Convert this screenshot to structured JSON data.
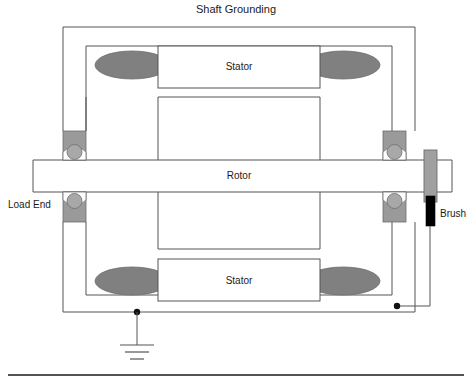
{
  "diagram": {
    "title": "Shaft Grounding",
    "labels": {
      "title": "Shaft Grounding",
      "stator_top": "Stator",
      "stator_bottom": "Stator",
      "rotor": "Rotor",
      "load_end": "Load End",
      "brush": "Brush"
    },
    "parts": [
      {
        "name": "frame-housing",
        "label": ""
      },
      {
        "name": "stator-core-top",
        "label": "Stator"
      },
      {
        "name": "stator-core-bottom",
        "label": "Stator"
      },
      {
        "name": "rotor-shaft",
        "label": "Rotor"
      },
      {
        "name": "bearing-load-end-top",
        "label": ""
      },
      {
        "name": "bearing-load-end-bottom",
        "label": ""
      },
      {
        "name": "bearing-drive-end-top",
        "label": ""
      },
      {
        "name": "bearing-drive-end-bottom",
        "label": ""
      },
      {
        "name": "slip-ring",
        "label": ""
      },
      {
        "name": "brush",
        "label": "Brush"
      },
      {
        "name": "ground-symbol",
        "label": ""
      }
    ],
    "colors": {
      "line": "#555555",
      "line_dark": "#1b1b1b",
      "end_winding_fill": "#808080",
      "bearing_fill": "#9a9a9a",
      "ball_fill": "#a8a8a8",
      "slip_ring_fill": "#a0a0a0",
      "brush_fill": "#000000",
      "background": "#ffffff",
      "text": "#1b1b1b"
    }
  }
}
